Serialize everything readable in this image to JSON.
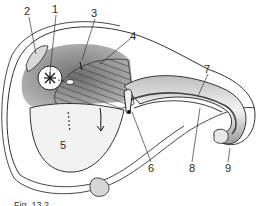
{
  "figure": {
    "caption": "Fig. 13.2",
    "labels": [
      {
        "id": "1",
        "text": "1",
        "x": 52,
        "y": 4
      },
      {
        "id": "2",
        "text": "2",
        "x": 24,
        "y": 6
      },
      {
        "id": "3",
        "text": "3",
        "x": 91,
        "y": 8
      },
      {
        "id": "4",
        "text": "4",
        "x": 130,
        "y": 31
      },
      {
        "id": "5",
        "text": "5",
        "x": 60,
        "y": 140
      },
      {
        "id": "6",
        "text": "6",
        "x": 150,
        "y": 163
      },
      {
        "id": "7",
        "text": "7",
        "x": 204,
        "y": 64
      },
      {
        "id": "8",
        "text": "8",
        "x": 189,
        "y": 163
      },
      {
        "id": "9",
        "text": "9",
        "x": 225,
        "y": 163
      }
    ]
  }
}
